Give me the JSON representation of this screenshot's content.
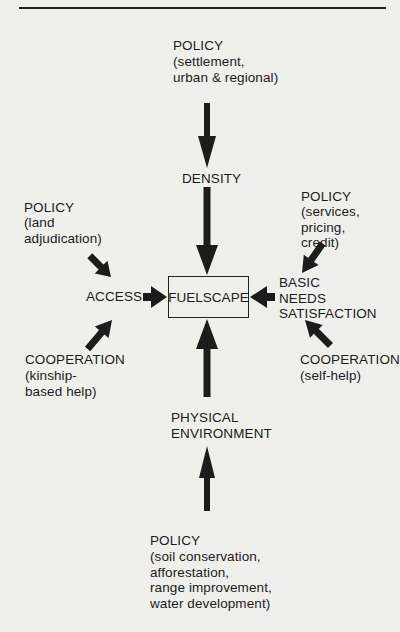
{
  "diagram": {
    "center": {
      "label": "FUELSCAPE"
    },
    "nodes": {
      "density": {
        "label": "DENSITY"
      },
      "access": {
        "label": "ACCESS"
      },
      "basic_needs": {
        "label": "BASIC\nNEEDS\nSATISFACTION"
      },
      "physical_env": {
        "label": "PHYSICAL\nENVIRONMENT"
      }
    },
    "influences": {
      "policy_top": {
        "title": "POLICY",
        "detail": "(settlement,\nurban & regional)"
      },
      "policy_left": {
        "title": "POLICY",
        "detail": "(land\nadjudication)"
      },
      "policy_right": {
        "title": "POLICY",
        "detail": "(services,\npricing,\ncredit)"
      },
      "coop_left": {
        "title": "COOPERATION",
        "detail": "(kinship-\nbased help)"
      },
      "coop_right": {
        "title": "COOPERATION",
        "detail": "(self-help)"
      },
      "policy_bottom": {
        "title": "POLICY",
        "detail": "(soil conservation,\nafforestation,\nrange improvement,\nwater development)"
      }
    },
    "edges": [
      {
        "from": "policy_top",
        "to": "density"
      },
      {
        "from": "density",
        "to": "center"
      },
      {
        "from": "policy_left",
        "to": "access"
      },
      {
        "from": "coop_left",
        "to": "access"
      },
      {
        "from": "access",
        "to": "center"
      },
      {
        "from": "policy_right",
        "to": "basic_needs"
      },
      {
        "from": "coop_right",
        "to": "basic_needs"
      },
      {
        "from": "basic_needs",
        "to": "center"
      },
      {
        "from": "policy_bottom",
        "to": "physical_env"
      },
      {
        "from": "physical_env",
        "to": "center"
      }
    ],
    "colors": {
      "ink": "#1c1c1c",
      "paper": "#efefec"
    }
  }
}
